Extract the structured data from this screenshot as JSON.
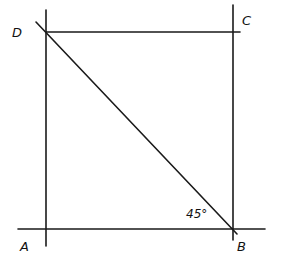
{
  "diagram": {
    "type": "geometry-square-with-diagonal",
    "vertices": {
      "A": {
        "label": "A"
      },
      "B": {
        "label": "B"
      },
      "C": {
        "label": "C"
      },
      "D": {
        "label": "D"
      }
    },
    "segments": [
      {
        "name": "side-AD",
        "from": "A",
        "to": "D"
      },
      {
        "name": "side-BC",
        "from": "B",
        "to": "C"
      },
      {
        "name": "side-DC",
        "from": "D",
        "to": "C"
      },
      {
        "name": "side-AB",
        "from": "A",
        "to": "B"
      },
      {
        "name": "diagonal-DB",
        "from": "D",
        "to": "B"
      }
    ],
    "angle_annotation": {
      "at_vertex": "B",
      "between": [
        "BA",
        "BD"
      ],
      "text": "45°",
      "degrees": 45
    }
  }
}
